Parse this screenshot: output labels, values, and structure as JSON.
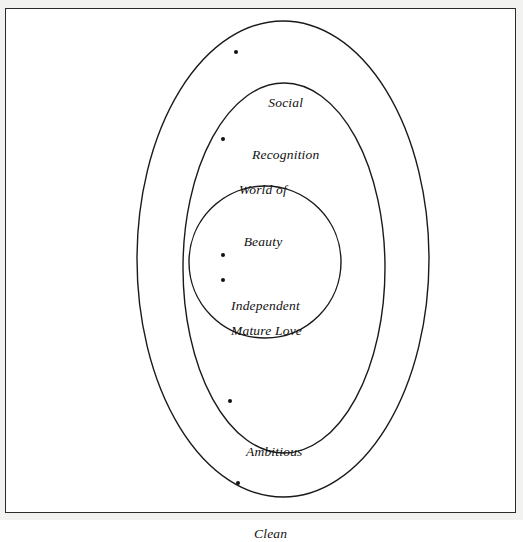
{
  "figure": {
    "type": "nested-ellipse-venn",
    "background_color": "#ffffff",
    "frame_color": "#2b2b2b",
    "line_color": "#1a1a1a",
    "text_color": "#111111"
  },
  "regions": [
    {
      "id": "outer",
      "name": "outer-ellipse",
      "shape": "ellipse",
      "cx": 283,
      "cy": 259,
      "rx": 146,
      "ry": 238
    },
    {
      "id": "middle",
      "name": "middle-ellipse",
      "shape": "ellipse",
      "cx": 284,
      "cy": 268,
      "rx": 101,
      "ry": 185
    },
    {
      "id": "inner",
      "name": "inner-circle",
      "shape": "circle",
      "cx": 265,
      "cy": 262,
      "r": 76
    }
  ],
  "labels": {
    "social_recognition": {
      "line1": "Social",
      "line2": "Recognition",
      "region": "outer"
    },
    "world_of_beauty": {
      "line1": "World of",
      "line2": "Beauty",
      "region": "middle"
    },
    "independent": {
      "text": "Independent",
      "region": "inner"
    },
    "mature_love": {
      "text": "Mature Love",
      "region": "inner"
    },
    "ambitious": {
      "text": "Ambitious",
      "region": "middle"
    },
    "clean": {
      "text": "Clean",
      "region": "outer"
    }
  }
}
